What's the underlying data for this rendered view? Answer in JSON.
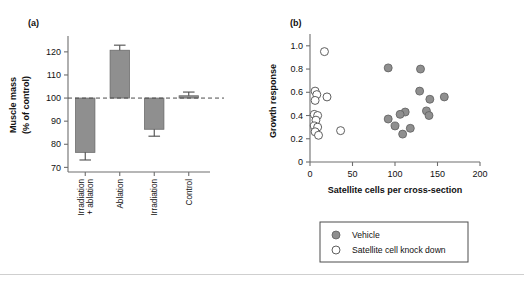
{
  "figure": {
    "panel_a_label": "(a)",
    "panel_b_label": "(b)"
  },
  "chart_data": [
    {
      "type": "bar",
      "panel": "(a)",
      "title": "",
      "xlabel": "",
      "ylabel": "Muscle mass\n(% of control)",
      "ylabel_line1": "Muscle mass",
      "ylabel_line2": "(% of control)",
      "categories": [
        "Irradiation + ablation",
        "Ablation",
        "Irradiation",
        "Control"
      ],
      "category_lines": [
        [
          "Irradiation",
          "+ ablation"
        ],
        [
          "Ablation"
        ],
        [
          "Irradiation"
        ],
        [
          "Control"
        ]
      ],
      "values": [
        76.5,
        120.7,
        86.5,
        101.0
      ],
      "errors": [
        3.3,
        2.2,
        3.0,
        1.6
      ],
      "baseline": 100,
      "reference_line": 100,
      "ylim": [
        68,
        126
      ],
      "yticks": [
        70,
        80,
        90,
        100,
        110,
        120
      ],
      "ytick_labels": [
        "70",
        "80",
        "90",
        "100",
        "110",
        "120"
      ],
      "grid": false,
      "bar_color": "#8f8f8f",
      "error_color": "#4d4d4d"
    },
    {
      "type": "scatter",
      "panel": "(b)",
      "title": "",
      "xlabel": "Satellite cells per cross-section",
      "ylabel": "Growth response",
      "xlim": [
        0,
        200
      ],
      "ylim": [
        0,
        1.05
      ],
      "xticks": [
        0,
        50,
        100,
        150,
        200
      ],
      "xtick_labels": [
        "0",
        "50",
        "100",
        "150",
        "200"
      ],
      "yticks": [
        0,
        0.2,
        0.4,
        0.6,
        0.8,
        1.0
      ],
      "ytick_labels": [
        "0",
        "0.2",
        "0.4",
        "0.6",
        "0.8",
        "1.0"
      ],
      "grid": false,
      "legend_position": "below",
      "series": [
        {
          "name": "Vehicle",
          "marker": "filled-circle",
          "color": "#8f8f8f",
          "points": [
            [
              92,
              0.81
            ],
            [
              130,
              0.8
            ],
            [
              129,
              0.61
            ],
            [
              141,
              0.54
            ],
            [
              158,
              0.56
            ],
            [
              137,
              0.44
            ],
            [
              140,
              0.4
            ],
            [
              112,
              0.43
            ],
            [
              106,
              0.41
            ],
            [
              92,
              0.37
            ],
            [
              100,
              0.31
            ],
            [
              109,
              0.24
            ],
            [
              118,
              0.29
            ]
          ]
        },
        {
          "name": "Satellite cell knock down",
          "marker": "open-circle",
          "color": "#ffffff",
          "points": [
            [
              17,
              0.95
            ],
            [
              6,
              0.61
            ],
            [
              8,
              0.58
            ],
            [
              20,
              0.56
            ],
            [
              6,
              0.53
            ],
            [
              5,
              0.41
            ],
            [
              9,
              0.4
            ],
            [
              7,
              0.36
            ],
            [
              5,
              0.31
            ],
            [
              9,
              0.3
            ],
            [
              6,
              0.26
            ],
            [
              10,
              0.23
            ],
            [
              36,
              0.27
            ]
          ]
        }
      ]
    }
  ]
}
